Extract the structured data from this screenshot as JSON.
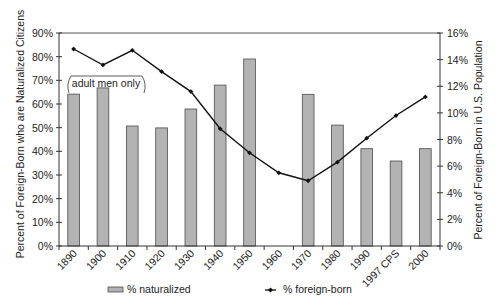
{
  "chart_data": {
    "type": "bar+line",
    "title": "",
    "categories": [
      "1890",
      "1900",
      "1910",
      "1920",
      "1930",
      "1940",
      "1950",
      "1960",
      "1970",
      "1980",
      "1990",
      "1997 CPS",
      "2000"
    ],
    "series": [
      {
        "name": "% naturalized",
        "type": "bar",
        "axis": "left",
        "color": "#b3b3b3",
        "border": "#4d4d4d",
        "values": [
          64.2,
          66.8,
          50.7,
          49.9,
          57.9,
          68.0,
          79.0,
          null,
          64.1,
          51.1,
          41.1,
          35.9,
          41.1
        ]
      },
      {
        "name": "% foreign-born",
        "type": "line",
        "axis": "right",
        "color": "#111111",
        "marker": "diamond",
        "values": [
          14.8,
          13.6,
          14.7,
          13.1,
          11.6,
          8.8,
          7.0,
          5.5,
          4.9,
          6.3,
          8.1,
          9.8,
          11.2
        ]
      }
    ],
    "ylabel": "Percent of Foreign-Born who are Naturalized Citizens",
    "ylabel_right": "Percent of Foreign-Born in U.S. Population",
    "xlabel": "",
    "ylim": [
      0,
      90
    ],
    "ylim_right": [
      0,
      16
    ],
    "yticks": [
      "0%",
      "10%",
      "20%",
      "30%",
      "40%",
      "50%",
      "60%",
      "70%",
      "80%",
      "90%"
    ],
    "yticks_right": [
      "0%",
      "2%",
      "4%",
      "6%",
      "8%",
      "10%",
      "12%",
      "14%",
      "16%"
    ],
    "grid": false,
    "legend_position": "bottom",
    "annotations": [
      {
        "text": "adult men only",
        "spans": [
          "1890",
          "1910"
        ]
      }
    ]
  },
  "legend": {
    "naturalized": "% naturalized",
    "foreign_born": "% foreign-born"
  },
  "annotation": {
    "adult_men": "adult men only"
  }
}
